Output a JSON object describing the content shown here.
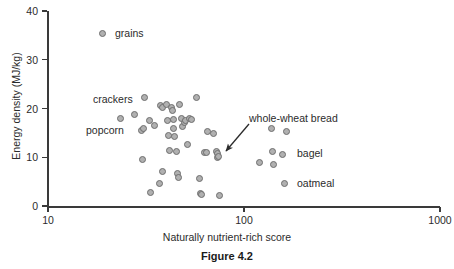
{
  "figure": {
    "caption": "Figure 4.2"
  },
  "chart_data": {
    "type": "scatter",
    "title": "",
    "xlabel": "Naturally nutrient-rich score",
    "ylabel": "Energy density (MJ/kg)",
    "xscale": "log",
    "yscale": "linear",
    "xlim": [
      10,
      1000
    ],
    "ylim": [
      0,
      40
    ],
    "grid": false,
    "legend": "none",
    "xticks": [
      {
        "value": 10,
        "label": "10"
      },
      {
        "value": 100,
        "label": "100"
      },
      {
        "value": 1000,
        "label": "1000"
      }
    ],
    "yticks": [
      {
        "value": 0,
        "label": "0"
      },
      {
        "value": 10,
        "label": "10"
      },
      {
        "value": 20,
        "label": "20"
      },
      {
        "value": 30,
        "label": "30"
      },
      {
        "value": 40,
        "label": "40"
      }
    ],
    "series": [
      {
        "name": "foods",
        "marker": "circle",
        "marker_fill": "#b0b0b0",
        "marker_edge": "#6e6e6e",
        "points": [
          {
            "x": 19.0,
            "y": 35.3
          },
          {
            "x": 23.5,
            "y": 18.0
          },
          {
            "x": 27.5,
            "y": 18.8
          },
          {
            "x": 31.0,
            "y": 22.3
          },
          {
            "x": 30.0,
            "y": 15.5
          },
          {
            "x": 30.8,
            "y": 16.0
          },
          {
            "x": 30.5,
            "y": 9.5
          },
          {
            "x": 33.0,
            "y": 17.6
          },
          {
            "x": 33.5,
            "y": 2.8
          },
          {
            "x": 35.0,
            "y": 16.5
          },
          {
            "x": 37.5,
            "y": 20.6
          },
          {
            "x": 38.2,
            "y": 20.2
          },
          {
            "x": 37.0,
            "y": 4.7
          },
          {
            "x": 38.5,
            "y": 7.0
          },
          {
            "x": 40.0,
            "y": 20.8
          },
          {
            "x": 40.5,
            "y": 17.5
          },
          {
            "x": 41.0,
            "y": 14.5
          },
          {
            "x": 41.5,
            "y": 11.3
          },
          {
            "x": 42.5,
            "y": 20.3
          },
          {
            "x": 43.0,
            "y": 19.5
          },
          {
            "x": 43.5,
            "y": 17.7
          },
          {
            "x": 43.8,
            "y": 16.0
          },
          {
            "x": 44.0,
            "y": 14.3
          },
          {
            "x": 45.5,
            "y": 11.2
          },
          {
            "x": 46.0,
            "y": 6.6
          },
          {
            "x": 46.5,
            "y": 5.9
          },
          {
            "x": 47.0,
            "y": 20.8
          },
          {
            "x": 48.0,
            "y": 17.9
          },
          {
            "x": 48.5,
            "y": 16.3
          },
          {
            "x": 49.5,
            "y": 17.2
          },
          {
            "x": 50.5,
            "y": 17.6
          },
          {
            "x": 51.5,
            "y": 12.7
          },
          {
            "x": 53.0,
            "y": 17.9
          },
          {
            "x": 54.0,
            "y": 17.8
          },
          {
            "x": 57.0,
            "y": 22.2
          },
          {
            "x": 59.0,
            "y": 5.6
          },
          {
            "x": 60.0,
            "y": 2.5
          },
          {
            "x": 60.8,
            "y": 2.3
          },
          {
            "x": 63.0,
            "y": 11.0
          },
          {
            "x": 64.5,
            "y": 10.9
          },
          {
            "x": 65.0,
            "y": 15.2
          },
          {
            "x": 70.0,
            "y": 14.8
          },
          {
            "x": 72.0,
            "y": 11.2
          },
          {
            "x": 73.0,
            "y": 10.8
          },
          {
            "x": 73.5,
            "y": 9.9
          },
          {
            "x": 74.5,
            "y": 10.2
          },
          {
            "x": 75.0,
            "y": 2.1
          },
          {
            "x": 120.0,
            "y": 9.0
          },
          {
            "x": 138.0,
            "y": 16.0
          },
          {
            "x": 140.0,
            "y": 11.1
          },
          {
            "x": 142.0,
            "y": 8.5
          },
          {
            "x": 158.0,
            "y": 10.6
          },
          {
            "x": 165.0,
            "y": 15.3
          },
          {
            "x": 160.0,
            "y": 4.6
          }
        ]
      }
    ],
    "annotations": [
      {
        "name": "grains",
        "text": "grains",
        "x_px": 115,
        "y_px": 33
      },
      {
        "name": "crackers",
        "text": "crackers",
        "x_px": 93,
        "y_px": 99
      },
      {
        "name": "popcorn",
        "text": "popcorn",
        "x_px": 86,
        "y_px": 130
      },
      {
        "name": "whole-wheat-bread",
        "text": "whole-wheat bread",
        "x_px": 249,
        "y_px": 118
      },
      {
        "name": "bagel",
        "text": "bagel",
        "x_px": 297,
        "y_px": 153
      },
      {
        "name": "oatmeal",
        "text": "oatmeal",
        "x_px": 297,
        "y_px": 183
      }
    ],
    "arrow": {
      "name": "whole-wheat-bread-arrow",
      "from_px": [
        249,
        124
      ],
      "to_px": [
        226,
        151
      ]
    }
  }
}
